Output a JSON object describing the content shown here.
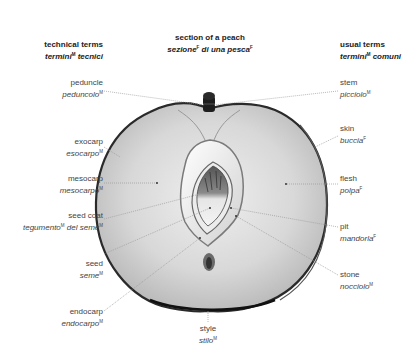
{
  "title": {
    "en": "section of a peach",
    "it": "sezione",
    "it_sup": "F",
    "it_rest": " di una pesca",
    "it_rest_sup": "F"
  },
  "headers": {
    "left": {
      "en": "technical terms",
      "it": "termini",
      "it_sup": "M",
      "it_rest": " tecnici"
    },
    "right": {
      "en": "usual terms",
      "it": "termini",
      "it_sup": "M",
      "it_rest": " comuni"
    }
  },
  "left_labels": [
    {
      "id": "peduncle",
      "en": "peduncle",
      "it": "peduncolo",
      "sup": "M"
    },
    {
      "id": "exocarp",
      "en": "exocarp",
      "it": "esocarpo",
      "sup": "M"
    },
    {
      "id": "mesocarp",
      "en": "mesocarp",
      "it": "mesocarpo",
      "sup": "M"
    },
    {
      "id": "seed-coat",
      "en": "seed coat",
      "it": "tegumento",
      "sup": "M",
      "it_rest": " del seme",
      "rest_sup": "M"
    },
    {
      "id": "seed",
      "en": "seed",
      "it": "seme",
      "sup": "M"
    },
    {
      "id": "endocarp",
      "en": "endocarp",
      "it": "endocarpo",
      "sup": "M"
    }
  ],
  "right_labels": [
    {
      "id": "stem",
      "en": "stem",
      "it": "picciolo",
      "sup": "M"
    },
    {
      "id": "skin",
      "en": "skin",
      "it": "buccia",
      "sup": "F"
    },
    {
      "id": "flesh",
      "en": "flesh",
      "it": "polpa",
      "sup": "F"
    },
    {
      "id": "pit",
      "en": "pit",
      "it": "mandorla",
      "sup": "F"
    },
    {
      "id": "stone",
      "en": "stone",
      "it": "nocciolo",
      "sup": "M"
    }
  ],
  "bottom_label": {
    "id": "style",
    "en": "style",
    "it": "stilo",
    "sup": "M"
  },
  "colors": {
    "flesh": "#d9d9d9",
    "skin": "#3a3a3a",
    "stone": "#f2f2f2",
    "leader": "#9a9a9a"
  }
}
